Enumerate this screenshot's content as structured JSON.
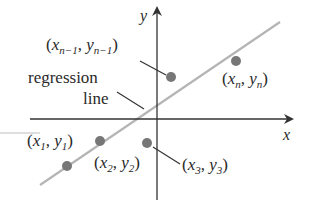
{
  "figure": {
    "axes": {
      "x_label": "x",
      "y_label": "y"
    },
    "regression_label_line1": "regression",
    "regression_label_line2": "line",
    "points": [
      {
        "name": "x1_y1",
        "var_x": "x",
        "sub_x": "1",
        "var_y": "y",
        "sub_y": "1"
      },
      {
        "name": "x2_y2",
        "var_x": "x",
        "sub_x": "2",
        "var_y": "y",
        "sub_y": "2"
      },
      {
        "name": "x3_y3",
        "var_x": "x",
        "sub_x": "3",
        "var_y": "y",
        "sub_y": "3"
      },
      {
        "name": "xn1_yn1",
        "var_x": "x",
        "sub_x": "n−1",
        "var_y": "y",
        "sub_y": "n−1"
      },
      {
        "name": "xn_yn",
        "var_x": "x",
        "sub_x": "n",
        "var_y": "y",
        "sub_y": "n"
      }
    ],
    "colors": {
      "axis": "#333333",
      "regression_line": "#b5b5b5",
      "point": "#777777",
      "text": "#2a2a2a"
    }
  }
}
